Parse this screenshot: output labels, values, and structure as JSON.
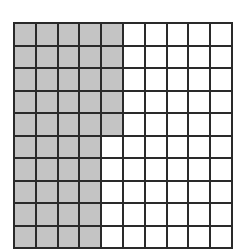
{
  "grid": {
    "rows": 10,
    "cols": 10,
    "shaded_color": "#c4c4c4",
    "unshaded_color": "#ffffff",
    "line_color": "#2a2a2a",
    "shaded_per_row": [
      5,
      5,
      5,
      5,
      5,
      4,
      4,
      4,
      4,
      4
    ],
    "total_cells": 100,
    "total_shaded": 45
  }
}
